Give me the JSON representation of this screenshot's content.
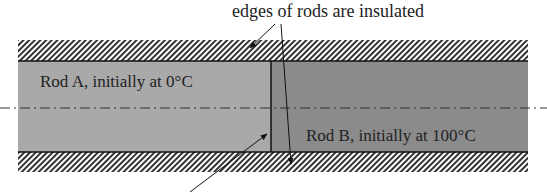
{
  "diagram": {
    "annotation_top": "edges of rods are insulated",
    "rod_a": {
      "label": "Rod A, initially at 0°C",
      "color": "#a8a8a8"
    },
    "rod_b": {
      "label": "Rod B, initially at 100°C",
      "color": "#8a8a8a"
    },
    "insulation": {
      "hatch_color": "#333333"
    },
    "centerline": "dash-dot axis of symmetry",
    "interface_arrow": "points to contact interface between rods"
  }
}
